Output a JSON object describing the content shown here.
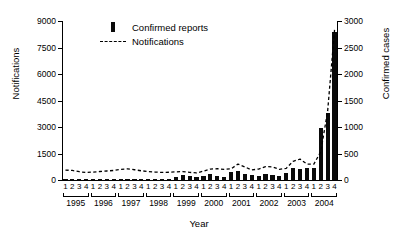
{
  "chart_data": {
    "type": "bar",
    "title": "",
    "xlabel": "Year",
    "ylabel": "Notifications",
    "y2label": "Confirmed cases",
    "ylim": [
      0,
      9000
    ],
    "y2lim": [
      0,
      3000
    ],
    "grid": false,
    "legend_position": "top-left",
    "yticks": [
      "0",
      "1500",
      "3000",
      "4500",
      "6000",
      "7500",
      "9000"
    ],
    "ytick_values": [
      0,
      1500,
      3000,
      4500,
      6000,
      7500,
      9000
    ],
    "y2ticks": [
      "0",
      "500",
      "1000",
      "1500",
      "2000",
      "2500",
      "3000"
    ],
    "y2tick_values": [
      0,
      500,
      1000,
      1500,
      2000,
      2500,
      3000
    ],
    "years": [
      "1995",
      "1996",
      "1997",
      "1998",
      "1999",
      "2000",
      "2001",
      "2002",
      "2003",
      "2004"
    ],
    "quarters": [
      "1",
      "2",
      "3",
      "4"
    ],
    "categories": [
      "1995 1",
      "1995 2",
      "1995 3",
      "1995 4",
      "1996 1",
      "1996 2",
      "1996 3",
      "1996 4",
      "1997 1",
      "1997 2",
      "1997 3",
      "1997 4",
      "1998 1",
      "1998 2",
      "1998 3",
      "1998 4",
      "1999 1",
      "1999 2",
      "1999 3",
      "1999 4",
      "2000 1",
      "2000 2",
      "2000 3",
      "2000 4",
      "2001 1",
      "2001 2",
      "2001 3",
      "2001 4",
      "2002 1",
      "2002 2",
      "2002 3",
      "2002 4",
      "2003 1",
      "2003 2",
      "2003 3",
      "2003 4",
      "2004 1",
      "2004 2",
      "2004 3",
      "2004 4"
    ],
    "series": [
      {
        "name": "Confirmed reports",
        "type": "bar",
        "axis": "right",
        "color": "#0a0a0a",
        "values": [
          8,
          6,
          6,
          8,
          10,
          12,
          10,
          14,
          18,
          22,
          18,
          20,
          16,
          18,
          20,
          22,
          60,
          95,
          70,
          60,
          75,
          105,
          85,
          60,
          150,
          175,
          115,
          95,
          80,
          115,
          100,
          75,
          140,
          235,
          205,
          225,
          235,
          980,
          1270,
          2800
        ]
      },
      {
        "name": "Notifications",
        "type": "line",
        "axis": "left",
        "style": "dashed",
        "color": "#000000",
        "values": [
          560,
          540,
          470,
          420,
          450,
          480,
          510,
          540,
          600,
          630,
          580,
          520,
          480,
          450,
          430,
          440,
          460,
          480,
          430,
          400,
          500,
          620,
          640,
          600,
          630,
          900,
          740,
          570,
          620,
          760,
          740,
          600,
          660,
          1060,
          1180,
          900,
          900,
          1600,
          3900,
          8500
        ]
      }
    ],
    "legend": [
      {
        "label": "Confirmed reports",
        "marker": "bar-swatch"
      },
      {
        "label": "Notifications",
        "marker": "dashed-line-swatch"
      }
    ]
  }
}
